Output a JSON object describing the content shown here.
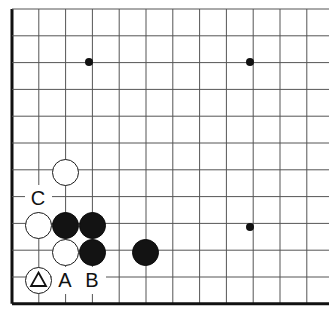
{
  "board": {
    "kind": "go-board-diagram",
    "view": "bottom-left-corner",
    "size": 19,
    "grid": {
      "spacing_px": 26.8,
      "origin_x_px": 12,
      "origin_y_px": 9,
      "columns_visible": 12,
      "rows_visible": 12,
      "edge_line_color": "#111111",
      "inner_line_color": "#555555",
      "background_color": "#ffffff"
    },
    "edges": {
      "left": true,
      "bottom": true,
      "top": false,
      "right": false
    },
    "star_points": [
      {
        "x_px": 89,
        "y_px": 62
      },
      {
        "x_px": 250,
        "y_px": 62
      },
      {
        "x_px": 250,
        "y_px": 227
      }
    ],
    "stones": [
      {
        "color": "white",
        "x_px": 65,
        "y_px": 172
      },
      {
        "color": "white",
        "x_px": 38,
        "y_px": 225
      },
      {
        "color": "black",
        "x_px": 65,
        "y_px": 225
      },
      {
        "color": "black",
        "x_px": 92,
        "y_px": 225
      },
      {
        "color": "white",
        "x_px": 65,
        "y_px": 252
      },
      {
        "color": "black",
        "x_px": 92,
        "y_px": 252
      },
      {
        "color": "black",
        "x_px": 145,
        "y_px": 252
      },
      {
        "color": "white",
        "x_px": 38,
        "y_px": 280
      }
    ],
    "markers": [
      {
        "type": "triangle",
        "on_color": "white",
        "x_px": 38,
        "y_px": 280
      }
    ],
    "labels": [
      {
        "text": "C",
        "x_px": 38,
        "y_px": 198
      },
      {
        "text": "A",
        "x_px": 65,
        "y_px": 280
      },
      {
        "text": "B",
        "x_px": 92,
        "y_px": 280
      }
    ]
  }
}
